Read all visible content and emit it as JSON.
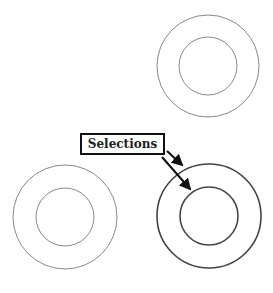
{
  "label": {
    "text": "Selections"
  },
  "colors": {
    "unselected_stroke": "#888888",
    "selected_stroke": "#444444",
    "arrow": "#111111"
  },
  "shapes": [
    {
      "name": "ring-top-right",
      "cx": 208,
      "cy": 66,
      "outer_r": 51,
      "inner_r": 29,
      "selected": false
    },
    {
      "name": "ring-bottom-left",
      "cx": 65,
      "cy": 217,
      "outer_r": 52,
      "inner_r": 29,
      "selected": false
    },
    {
      "name": "ring-bottom-right",
      "cx": 209,
      "cy": 216,
      "outer_r": 52,
      "inner_r": 29,
      "selected": true
    }
  ]
}
